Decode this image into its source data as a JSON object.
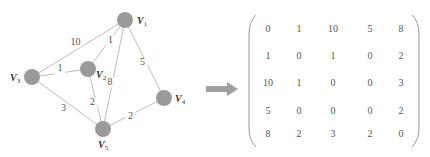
{
  "graph": {
    "nodes": [
      {
        "id": "V1",
        "label": "V",
        "sub": "1",
        "x": 125,
        "y": 20
      },
      {
        "id": "V2",
        "label": "V",
        "sub": "2",
        "x": 88,
        "y": 69
      },
      {
        "id": "V3",
        "label": "V",
        "sub": "3",
        "x": 32,
        "y": 77
      },
      {
        "id": "V4",
        "label": "V",
        "sub": "4",
        "x": 164,
        "y": 98
      },
      {
        "id": "V5",
        "label": "V",
        "sub": "5",
        "x": 103,
        "y": 129
      }
    ],
    "edges": [
      {
        "from": "V1",
        "to": "V3",
        "weight": "10"
      },
      {
        "from": "V1",
        "to": "V2",
        "weight": "1"
      },
      {
        "from": "V1",
        "to": "V5",
        "weight": "8"
      },
      {
        "from": "V1",
        "to": "V4",
        "weight": "5"
      },
      {
        "from": "V3",
        "to": "V2",
        "weight": "1"
      },
      {
        "from": "V2",
        "to": "V5",
        "weight": "2"
      },
      {
        "from": "V3",
        "to": "V5",
        "weight": "3"
      },
      {
        "from": "V5",
        "to": "V4",
        "weight": "2"
      }
    ],
    "node_color": "#9a9a9a",
    "edge_color": "#bdbdbd"
  },
  "arrow": {
    "icon": "right-arrow-icon",
    "color": "#a0a0a0"
  },
  "matrix": {
    "rows": [
      [
        "0",
        "1",
        "10",
        "5",
        "8"
      ],
      [
        "1",
        "0",
        "1",
        "0",
        "2"
      ],
      [
        "10",
        "1",
        "0",
        "0",
        "3"
      ],
      [
        "5",
        "0",
        "0",
        "0",
        "2"
      ],
      [
        "8",
        "2",
        "3",
        "2",
        "0"
      ]
    ]
  }
}
